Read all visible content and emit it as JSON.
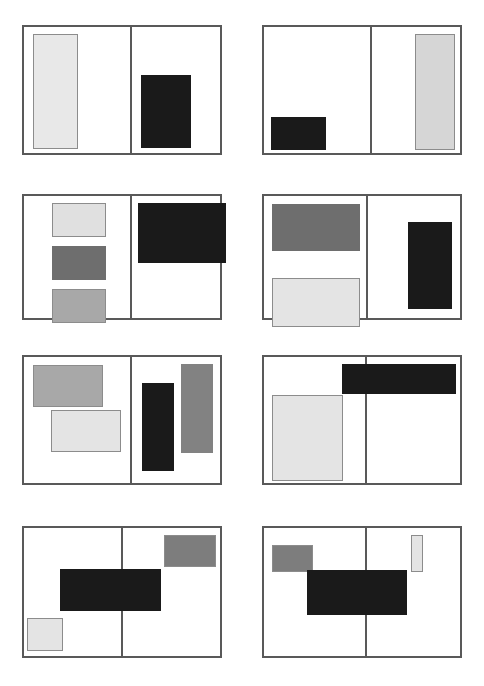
{
  "figure": {
    "title": "",
    "width": 484,
    "height": 686,
    "background": "#ffffff",
    "panel_border_color": "#595959",
    "shape_outline_color": "#8c8c8c",
    "palette": {
      "black": "#1a1a1a",
      "dark_gray": "#333333",
      "mid_gray": "#6e6e6e",
      "gray": "#8c8c8c",
      "light_gray": "#a8a8a8",
      "pale_gray": "#d6d6d6",
      "very_light_gray": "#e8e8e8",
      "white": "#ffffff"
    }
  },
  "panels": [
    {
      "id": "panel-1",
      "label": "Panel 1",
      "row": 1,
      "col": 1,
      "x": 22,
      "y": 25,
      "w": 200,
      "h": 130,
      "divider_x": 106,
      "shapes": [
        {
          "name": "shape-pale-tall-left",
          "x": 9,
          "y": 7,
          "w": 45,
          "h": 115,
          "fill": "#e8e8e8",
          "outline": true
        },
        {
          "name": "shape-black-block",
          "x": 117,
          "y": 48,
          "w": 50,
          "h": 73,
          "fill": "#1a1a1a",
          "outline": false
        }
      ]
    },
    {
      "id": "panel-2",
      "label": "Panel 2",
      "row": 1,
      "col": 2,
      "x": 262,
      "y": 25,
      "w": 200,
      "h": 130,
      "divider_x": 106,
      "shapes": [
        {
          "name": "shape-black-block",
          "x": 7,
          "y": 90,
          "w": 55,
          "h": 33,
          "fill": "#1a1a1a",
          "outline": false
        },
        {
          "name": "shape-pale-tall-right",
          "x": 151,
          "y": 7,
          "w": 40,
          "h": 116,
          "fill": "#d6d6d6",
          "outline": true
        }
      ]
    },
    {
      "id": "panel-3",
      "label": "Panel 3",
      "row": 2,
      "col": 1,
      "x": 22,
      "y": 194,
      "w": 200,
      "h": 126,
      "divider_x": 106,
      "shapes": [
        {
          "name": "shape-pale-rect",
          "x": 28,
          "y": 7,
          "w": 54,
          "h": 34,
          "fill": "#e0e0e0",
          "outline": true
        },
        {
          "name": "shape-mid-gray-rect",
          "x": 28,
          "y": 50,
          "w": 54,
          "h": 34,
          "fill": "#6e6e6e",
          "outline": false
        },
        {
          "name": "shape-light-gray-rect",
          "x": 28,
          "y": 93,
          "w": 54,
          "h": 34,
          "fill": "#a8a8a8",
          "outline": true
        },
        {
          "name": "shape-black-wide",
          "x": 114,
          "y": 7,
          "w": 88,
          "h": 60,
          "fill": "#1a1a1a",
          "outline": false
        }
      ]
    },
    {
      "id": "panel-4",
      "label": "Panel 4",
      "row": 2,
      "col": 2,
      "x": 262,
      "y": 194,
      "w": 200,
      "h": 126,
      "divider_x": 102,
      "shapes": [
        {
          "name": "shape-mid-gray-wide",
          "x": 8,
          "y": 8,
          "w": 88,
          "h": 47,
          "fill": "#6e6e6e",
          "outline": false
        },
        {
          "name": "shape-pale-wide",
          "x": 8,
          "y": 82,
          "w": 88,
          "h": 49,
          "fill": "#e4e4e4",
          "outline": true
        },
        {
          "name": "shape-black-tall",
          "x": 144,
          "y": 26,
          "w": 44,
          "h": 87,
          "fill": "#1a1a1a",
          "outline": false
        }
      ]
    },
    {
      "id": "panel-5",
      "label": "Panel 5",
      "row": 3,
      "col": 1,
      "x": 22,
      "y": 355,
      "w": 200,
      "h": 130,
      "divider_x": 106,
      "shapes": [
        {
          "name": "shape-light-gray-rect",
          "x": 9,
          "y": 8,
          "w": 70,
          "h": 42,
          "fill": "#a8a8a8",
          "outline": true
        },
        {
          "name": "shape-pale-rect",
          "x": 27,
          "y": 53,
          "w": 70,
          "h": 42,
          "fill": "#e4e4e4",
          "outline": true
        },
        {
          "name": "shape-black-tall",
          "x": 118,
          "y": 26,
          "w": 32,
          "h": 88,
          "fill": "#1a1a1a",
          "outline": false
        },
        {
          "name": "shape-gray-tall",
          "x": 157,
          "y": 7,
          "w": 32,
          "h": 89,
          "fill": "#828282",
          "outline": false
        }
      ]
    },
    {
      "id": "panel-6",
      "label": "Panel 6",
      "row": 3,
      "col": 2,
      "x": 262,
      "y": 355,
      "w": 200,
      "h": 130,
      "divider_x": 101,
      "shapes": [
        {
          "name": "shape-pale-square",
          "x": 8,
          "y": 38,
          "w": 71,
          "h": 86,
          "fill": "#e4e4e4",
          "outline": true
        }
      ],
      "overflow_shapes": [
        {
          "name": "shape-black-banner-crossing-divider",
          "x": 80,
          "y": 9,
          "w": 114,
          "h": 30,
          "fill": "#1a1a1a",
          "outline": false
        }
      ]
    },
    {
      "id": "panel-7",
      "label": "Panel 7",
      "row": 4,
      "col": 1,
      "x": 22,
      "y": 526,
      "w": 200,
      "h": 132,
      "divider_x": 97,
      "shapes": [
        {
          "name": "shape-gray-rect-top-right",
          "x": 140,
          "y": 7,
          "w": 52,
          "h": 32,
          "fill": "#7d7d7d",
          "outline": true
        },
        {
          "name": "shape-pale-square",
          "x": 3,
          "y": 90,
          "w": 36,
          "h": 33,
          "fill": "#e4e4e4",
          "outline": true
        }
      ],
      "overflow_shapes": [
        {
          "name": "shape-black-banner-crossing-divider",
          "x": 38,
          "y": 43,
          "w": 101,
          "h": 42,
          "fill": "#1a1a1a",
          "outline": false
        }
      ]
    },
    {
      "id": "panel-8",
      "label": "Panel 8",
      "row": 4,
      "col": 2,
      "x": 262,
      "y": 526,
      "w": 200,
      "h": 132,
      "divider_x": 101,
      "shapes": [
        {
          "name": "shape-gray-rect-top-left",
          "x": 8,
          "y": 17,
          "w": 41,
          "h": 27,
          "fill": "#7d7d7d",
          "outline": true
        },
        {
          "name": "shape-pale-tall-narrow",
          "x": 147,
          "y": 7,
          "w": 12,
          "h": 37,
          "fill": "#e4e4e4",
          "outline": true
        }
      ],
      "overflow_shapes": [
        {
          "name": "shape-black-banner-crossing-divider",
          "x": 45,
          "y": 44,
          "w": 100,
          "h": 45,
          "fill": "#1a1a1a",
          "outline": false
        }
      ]
    }
  ]
}
